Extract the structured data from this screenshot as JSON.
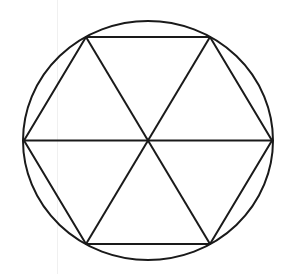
{
  "diagram": {
    "title": "",
    "stroke_color": "#1a1a1a",
    "background": "#ffffff",
    "circle": {
      "cx": 148,
      "cy": 140.5,
      "rx": 125,
      "ry": 119.5
    },
    "center": {
      "x": 148,
      "y": 140.5
    },
    "vertices": [
      {
        "x": 24,
        "y": 140.5
      },
      {
        "x": 86,
        "y": 37
      },
      {
        "x": 210,
        "y": 37
      },
      {
        "x": 272,
        "y": 140.5
      },
      {
        "x": 210,
        "y": 244
      },
      {
        "x": 86,
        "y": 244
      }
    ]
  }
}
